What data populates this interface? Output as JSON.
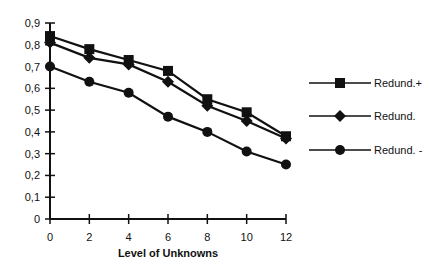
{
  "chart_data": {
    "type": "line",
    "title": "",
    "xlabel": "Level of Unknowns",
    "ylabel": "",
    "x": [
      0,
      2,
      4,
      6,
      8,
      10,
      12
    ],
    "xticks": [
      "0",
      "2",
      "4",
      "6",
      "8",
      "10",
      "12"
    ],
    "yticks": [
      "0",
      "0,1",
      "0,2",
      "0,3",
      "0,4",
      "0,5",
      "0,6",
      "0,7",
      "0,8",
      "0,9"
    ],
    "xlim": [
      0,
      12
    ],
    "ylim": [
      0,
      0.9
    ],
    "grid": false,
    "legend_position": "right",
    "series": [
      {
        "name": "Redund.+",
        "marker": "square",
        "values": [
          0.84,
          0.78,
          0.73,
          0.68,
          0.55,
          0.49,
          0.38
        ]
      },
      {
        "name": "Redund.",
        "marker": "diamond",
        "values": [
          0.81,
          0.74,
          0.71,
          0.63,
          0.52,
          0.45,
          0.37
        ]
      },
      {
        "name": "Redund. -",
        "marker": "circle",
        "values": [
          0.7,
          0.63,
          0.58,
          0.47,
          0.4,
          0.31,
          0.25
        ]
      }
    ]
  },
  "colors": {
    "line": "#111111",
    "background": "#ffffff"
  }
}
